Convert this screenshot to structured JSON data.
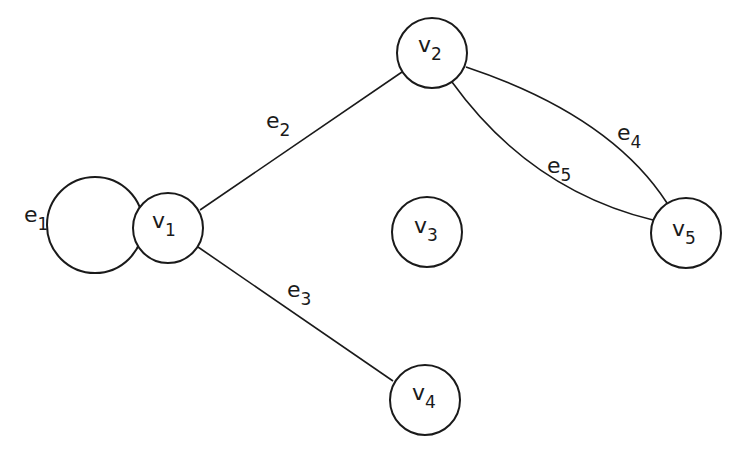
{
  "graph": {
    "vertices": [
      {
        "id": "v1",
        "name": "v",
        "sub": "1",
        "cx": 168,
        "cy": 228,
        "r": 35
      },
      {
        "id": "v2",
        "name": "v",
        "sub": "2",
        "cx": 432,
        "cy": 53,
        "r": 35
      },
      {
        "id": "v3",
        "name": "v",
        "sub": "3",
        "cx": 427,
        "cy": 232,
        "r": 35
      },
      {
        "id": "v4",
        "name": "v",
        "sub": "4",
        "cx": 425,
        "cy": 400,
        "r": 35
      },
      {
        "id": "v5",
        "name": "v",
        "sub": "5",
        "cx": 686,
        "cy": 233,
        "r": 35
      }
    ],
    "edges": [
      {
        "id": "e1",
        "name": "e",
        "sub": "1",
        "from": "v1",
        "to": "v1",
        "kind": "loop"
      },
      {
        "id": "e2",
        "name": "e",
        "sub": "2",
        "from": "v1",
        "to": "v2",
        "kind": "straight"
      },
      {
        "id": "e3",
        "name": "e",
        "sub": "3",
        "from": "v1",
        "to": "v4",
        "kind": "straight"
      },
      {
        "id": "e4",
        "name": "e",
        "sub": "4",
        "from": "v2",
        "to": "v5",
        "kind": "curve-upper"
      },
      {
        "id": "e5",
        "name": "e",
        "sub": "5",
        "from": "v2",
        "to": "v5",
        "kind": "curve-lower"
      }
    ],
    "colors": {
      "stroke": "#1a1a1a",
      "background": "#ffffff"
    }
  }
}
